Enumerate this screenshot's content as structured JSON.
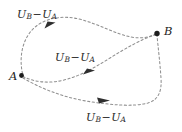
{
  "figure": {
    "type": "diagram",
    "background_color": "#ffffff",
    "stroke_color": "#8a8a8a",
    "text_color": "#2b2b2b",
    "points": [
      {
        "id": "A",
        "label": "A",
        "x": 21,
        "y": 75
      },
      {
        "id": "B",
        "label": "B",
        "x": 157,
        "y": 33
      }
    ],
    "paths": [
      {
        "id": "upper-path",
        "label": "U_B - U_A",
        "label_parts": {
          "first_var": "U",
          "first_sub": "B",
          "operator": "−",
          "second_var": "U",
          "second_sub": "A"
        },
        "arrow_direction": "up-right"
      },
      {
        "id": "middle-path",
        "label": "U_B - U_A",
        "label_parts": {
          "first_var": "U",
          "first_sub": "B",
          "operator": "−",
          "second_var": "U",
          "second_sub": "A"
        },
        "arrow_direction": "right"
      },
      {
        "id": "lower-path",
        "label": "U_B - U_A",
        "label_parts": {
          "first_var": "U",
          "first_sub": "B",
          "operator": "−",
          "second_var": "U",
          "second_sub": "A"
        },
        "arrow_direction": "right"
      }
    ]
  }
}
